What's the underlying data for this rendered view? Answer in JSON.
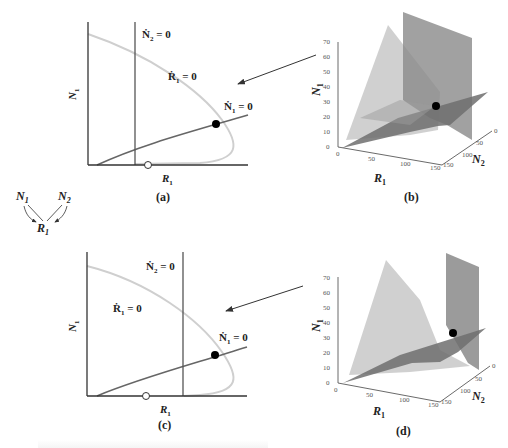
{
  "figure": {
    "panels": [
      {
        "id": "a",
        "label": "(a)",
        "type": "2d-isocline-plot",
        "x_axis_label": "R",
        "x_axis_sub": "1",
        "y_axis_label": "N",
        "y_axis_sub": "1",
        "isoclines": [
          {
            "name": "N2-dot",
            "text": "Ṅ",
            "sub": "2",
            "eq": " = 0"
          },
          {
            "name": "R1-dot",
            "text": "Ṙ",
            "sub": "1",
            "eq": " = 0"
          },
          {
            "name": "N1-dot",
            "text": "Ṅ",
            "sub": "1",
            "eq": " = 0"
          }
        ],
        "equilibrium": "filled-circle",
        "unstable_point": "open-circle"
      },
      {
        "id": "b",
        "label": "(b)",
        "type": "3d-isocline-surfaces",
        "x_axis_label": "R",
        "x_axis_sub": "1",
        "y_axis_label": "N",
        "y_axis_sub": "1",
        "z_axis_label": "N",
        "z_axis_sub": "2",
        "n1_ticks": [
          "0",
          "10",
          "20",
          "30",
          "40",
          "50",
          "60",
          "70"
        ],
        "r1_ticks": [
          "0",
          "50",
          "100",
          "150"
        ],
        "n2_ticks": [
          "0",
          "50",
          "100",
          "150"
        ]
      },
      {
        "id": "c",
        "label": "(c)",
        "type": "2d-isocline-plot",
        "x_axis_label": "R",
        "x_axis_sub": "1",
        "y_axis_label": "N",
        "y_axis_sub": "1",
        "isoclines": [
          {
            "name": "N2-dot",
            "text": "Ṅ",
            "sub": "2",
            "eq": " = 0"
          },
          {
            "name": "R1-dot",
            "text": "Ṙ",
            "sub": "1",
            "eq": " = 0"
          },
          {
            "name": "N1-dot",
            "text": "Ṅ",
            "sub": "1",
            "eq": " = 0"
          }
        ],
        "equilibrium": "filled-circle",
        "unstable_point": "open-circle"
      },
      {
        "id": "d",
        "label": "(d)",
        "type": "3d-isocline-surfaces",
        "x_axis_label": "R",
        "x_axis_sub": "1",
        "y_axis_label": "N",
        "y_axis_sub": "1",
        "z_axis_label": "N",
        "z_axis_sub": "2",
        "n1_ticks": [
          "0",
          "10",
          "20",
          "30",
          "40",
          "50",
          "60",
          "70"
        ],
        "r1_ticks": [
          "0",
          "50",
          "100",
          "150"
        ],
        "n2_ticks": [
          "0",
          "50",
          "100",
          "150"
        ]
      }
    ],
    "food_web": {
      "nodes": [
        {
          "text": "N",
          "sub": "1"
        },
        {
          "text": "N",
          "sub": "2"
        },
        {
          "text": "R",
          "sub": "1"
        }
      ],
      "edges": [
        "N1->R1",
        "N2->R1"
      ]
    },
    "colors": {
      "axis": "#333333",
      "n2_isocline": "#555555",
      "r1_isocline": "#cccccc",
      "n1_isocline": "#666666",
      "surface_light": "#c8c8c8",
      "surface_mid": "#8a8a8a",
      "surface_dark": "#6e6e6e",
      "point": "#000000"
    }
  }
}
